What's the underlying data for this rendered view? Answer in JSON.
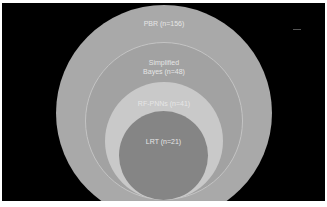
{
  "diagram": {
    "type": "nested-circles",
    "background_color": "#000000",
    "circles": [
      {
        "label": "PBR (n=156)",
        "color": "#a9a9a9"
      },
      {
        "label": "Simplified\nBayes (n=48)",
        "color": "#a2a2a2"
      },
      {
        "label": "RF-PNNs (n=41)",
        "color": "#c9c9c9"
      },
      {
        "label": "LRT (n=21)",
        "color": "#858585"
      }
    ]
  }
}
